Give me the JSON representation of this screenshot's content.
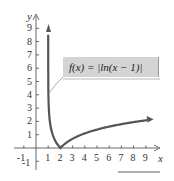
{
  "chart_data": {
    "type": "line",
    "title": "",
    "function_label": "f(x) = |ln(x − 1)|",
    "xlabel": "x",
    "ylabel": "y",
    "x_ticks": [
      "-1",
      "1",
      "2",
      "3",
      "4",
      "5",
      "6",
      "7",
      "8",
      "9"
    ],
    "y_ticks": [
      "-1",
      "1",
      "2",
      "3",
      "4",
      "5",
      "6",
      "7",
      "8",
      "9"
    ],
    "xlim": [
      -1.5,
      10
    ],
    "ylim": [
      -1.5,
      10
    ],
    "grid": false,
    "series": [
      {
        "name": "f(x) = |ln(x − 1)|",
        "x": [
          1.0001,
          1.01,
          1.05,
          1.1,
          1.2,
          1.4,
          1.7,
          2,
          3,
          4,
          5,
          6,
          7,
          8,
          9.3
        ],
        "values": [
          9.2,
          4.6,
          3.0,
          2.3,
          1.61,
          0.92,
          0.36,
          0,
          0.69,
          1.1,
          1.39,
          1.61,
          1.79,
          1.95,
          2.12
        ]
      }
    ],
    "asymptote": "x = 1",
    "color": "#555555"
  }
}
